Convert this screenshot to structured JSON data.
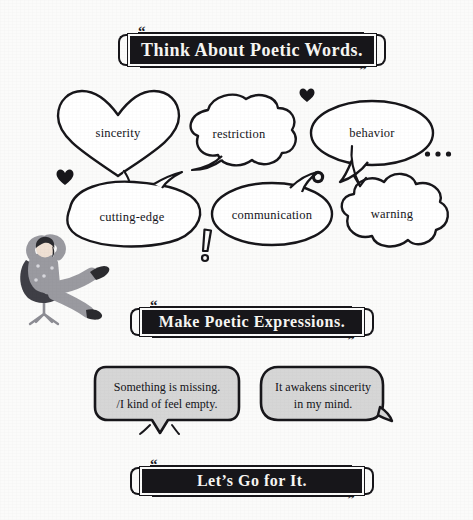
{
  "page": {
    "background_color": "#fbfbfa",
    "ink_color": "#17161a"
  },
  "banners": {
    "think": {
      "text": "Think About Poetic Words.",
      "open_quote": "“",
      "close_quote": "”"
    },
    "make": {
      "text": "Make Poetic Expressions.",
      "open_quote": "“",
      "close_quote": "”"
    },
    "go": {
      "text": "Let’s Go for It.",
      "open_quote": "“",
      "close_quote": "”"
    }
  },
  "word_bubbles": [
    {
      "id": "sincerity",
      "label": "sincerity",
      "shape": "heart"
    },
    {
      "id": "restriction",
      "label": "restriction",
      "shape": "cloud"
    },
    {
      "id": "behavior",
      "label": "behavior",
      "shape": "oval-speech"
    },
    {
      "id": "cutting-edge",
      "label": "cutting-edge",
      "shape": "bean"
    },
    {
      "id": "communication",
      "label": "communication",
      "shape": "round-speech"
    },
    {
      "id": "warning",
      "label": "warning",
      "shape": "thought-cloud"
    }
  ],
  "expressions": [
    {
      "id": "expr-1",
      "line1": "Something is missing.",
      "line2": "/I kind of feel empty."
    },
    {
      "id": "expr-2",
      "line1": "It awakens sincerity",
      "line2": "in my mind."
    }
  ],
  "decorations": [
    {
      "id": "heart-top",
      "glyph": "heart"
    },
    {
      "id": "heart-left",
      "glyph": "heart"
    },
    {
      "id": "dots",
      "glyph": "ellipsis"
    },
    {
      "id": "ring",
      "glyph": "circle-outline"
    },
    {
      "id": "exclamation",
      "glyph": "exclamation"
    }
  ],
  "illustration": {
    "name": "person-relaxing-in-office-chair",
    "skin_color": "#efe0d3",
    "hair_color": "#2b2b2f",
    "clothing_color": "#9a9aa0",
    "chair_color": "#44444a"
  }
}
